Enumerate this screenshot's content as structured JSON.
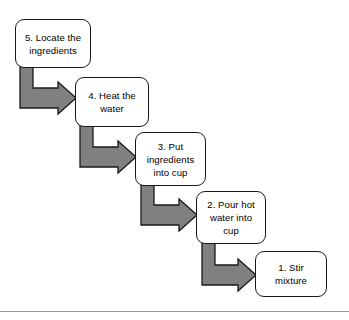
{
  "diagram": {
    "background_color": "#ffffff",
    "node_fill": "#ffffff",
    "node_border_color": "#1a1a1a",
    "arrow_color": "#808080",
    "arrow_outline_color": "#1a1a1a",
    "text_color": "#000000",
    "nodes": [
      {
        "id": "step-5",
        "label": "5. Locate the\ningredients",
        "x": 15,
        "y": 19,
        "width": 76,
        "height": 49
      },
      {
        "id": "step-4",
        "label": "4. Heat the\nwater",
        "x": 75,
        "y": 77,
        "width": 74,
        "height": 50
      },
      {
        "id": "step-3",
        "label": "3. Put\ningredients\ninto cup",
        "x": 135,
        "y": 132,
        "width": 71,
        "height": 54
      },
      {
        "id": "step-2",
        "label": "2. Pour hot\nwater into\ncup",
        "x": 196,
        "y": 191,
        "width": 70,
        "height": 53
      },
      {
        "id": "step-1",
        "label": "1. Stir\nmixture",
        "x": 255,
        "y": 251,
        "width": 72,
        "height": 46
      }
    ],
    "arrows": [
      {
        "id": "arrow-5-to-4",
        "from": "step-5",
        "to": "step-4",
        "shaft_x": 20,
        "shaft_top": 66,
        "shaft_width": 13,
        "elbow_bottom": 108,
        "arm_top": 88,
        "tip_x": 76,
        "head_back_x": 58,
        "head_top": 82,
        "head_bottom": 114
      },
      {
        "id": "arrow-4-to-3",
        "from": "step-4",
        "to": "step-3",
        "shaft_x": 80,
        "shaft_top": 125,
        "shaft_width": 13,
        "elbow_bottom": 167,
        "arm_top": 147,
        "tip_x": 136,
        "head_back_x": 118,
        "head_top": 141,
        "head_bottom": 173
      },
      {
        "id": "arrow-3-to-2",
        "from": "step-3",
        "to": "step-2",
        "shaft_x": 141,
        "shaft_top": 184,
        "shaft_width": 13,
        "elbow_bottom": 225,
        "arm_top": 205,
        "tip_x": 197,
        "head_back_x": 179,
        "head_top": 199,
        "head_bottom": 231
      },
      {
        "id": "arrow-2-to-1",
        "from": "step-2",
        "to": "step-1",
        "shaft_x": 202,
        "shaft_top": 242,
        "shaft_width": 13,
        "elbow_bottom": 285,
        "arm_top": 265,
        "tip_x": 256,
        "head_back_x": 238,
        "head_top": 259,
        "head_bottom": 291
      }
    ],
    "footer_rule": {
      "y": 311,
      "color": "#9a9a9a"
    }
  }
}
